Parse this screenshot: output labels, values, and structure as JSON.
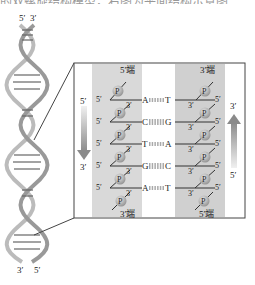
{
  "header": {
    "cut_text": "的双螺旋结构模型，右图为平面结构示意图"
  },
  "helix": {
    "top_labels": [
      "5′",
      "3′"
    ],
    "bottom_labels": [
      "3′",
      "5′"
    ]
  },
  "detail": {
    "left_strand": {
      "top_end": "5′端",
      "bottom_end": "3′端",
      "direction_top": "5′",
      "direction_bottom": "3′"
    },
    "right_strand": {
      "top_end": "3′端",
      "bottom_end": "5′端",
      "direction_top": "3′",
      "direction_bottom": "5′"
    },
    "phosphate": "P",
    "pairs": [
      {
        "left": "A",
        "right": "T"
      },
      {
        "left": "C",
        "right": "G"
      },
      {
        "left": "T",
        "right": "A"
      },
      {
        "left": "G",
        "right": "C"
      },
      {
        "left": "A",
        "right": "T"
      }
    ],
    "prime5": "5′",
    "prime3": "3′"
  },
  "colors": {
    "strand_band": "#d9d9d9",
    "phosphate": "#b0b0b0",
    "arrow": "#9a9a9a",
    "frame": "#444444"
  }
}
